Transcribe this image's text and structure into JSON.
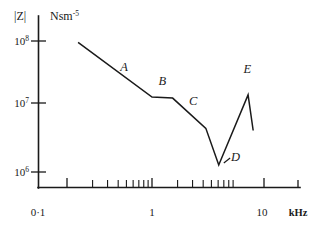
{
  "chart_data": {
    "type": "line",
    "title": "",
    "ylabel": "|Z|",
    "yunit": "Nsm",
    "yunit_exponent": "-5",
    "xlabel": "",
    "xunit": "kHz",
    "xscale": "log",
    "yscale": "log",
    "xlim": [
      0.1,
      20
    ],
    "ylim": [
      1000000,
      100000000
    ],
    "grid": false,
    "legend": "none",
    "y_ticks": [
      {
        "value": 100000000,
        "mantissa": "10",
        "exponent": "8"
      },
      {
        "value": 10000000,
        "mantissa": "10",
        "exponent": "7"
      },
      {
        "value": 1000000,
        "mantissa": "10",
        "exponent": "6"
      }
    ],
    "x_ticks": [
      {
        "value": 0.1,
        "label": "0·1",
        "major": true
      },
      {
        "value": 1,
        "label": "1",
        "major": true
      },
      {
        "value": 10,
        "label": "10",
        "major": true
      },
      {
        "value": 20,
        "label": "",
        "major": true
      }
    ],
    "x_minor_ticks": [
      0.2,
      0.3,
      0.4,
      0.5,
      0.6,
      0.7,
      0.8,
      0.9,
      2,
      3,
      4,
      5,
      6,
      7,
      8,
      9
    ],
    "series": [
      {
        "name": "impedance-magnitude",
        "points": [
          [
            0.135,
            95000000
          ],
          [
            1.0,
            12500000
          ],
          [
            1.75,
            12000000
          ],
          [
            4.3,
            3900000
          ],
          [
            6.1,
            1000000
          ],
          [
            13.5,
            13500000
          ],
          [
            15.5,
            3600000
          ]
        ]
      }
    ],
    "annotations": [
      {
        "id": "A",
        "label": "A",
        "x": 0.47,
        "y": 33000000
      },
      {
        "id": "B",
        "label": "B",
        "x": 1.32,
        "y": 19500000
      },
      {
        "id": "C",
        "label": "C",
        "x": 3.05,
        "y": 9200000
      },
      {
        "id": "D",
        "label": "D",
        "x": 9.6,
        "y": 1150000,
        "leader_from": [
          7.0,
          1080000
        ],
        "leader_to": [
          8.3,
          1300000
        ]
      },
      {
        "id": "E",
        "label": "E",
        "x": 13.2,
        "y": 31000000
      }
    ]
  }
}
